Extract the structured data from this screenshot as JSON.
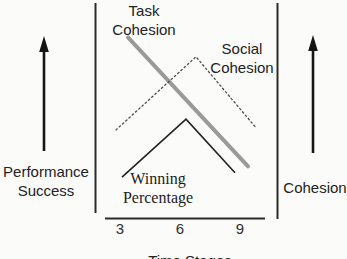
{
  "figure": {
    "background": "#fbfbfa",
    "frame_color": "#2b2b2b",
    "arrow_color": "#151515"
  },
  "axis_labels": {
    "left_line1": "Performance",
    "left_line2": "Success",
    "right": "Cohesion",
    "bottom": "Time Stages"
  },
  "series_labels": {
    "task_line1": "Task",
    "task_line2": "Cohesion",
    "social_line1": "Social",
    "social_line2": "Cohesion",
    "winning_line1": "Winning",
    "winning_line2": "Percentage"
  },
  "chart_data": {
    "type": "line",
    "title": "",
    "xlabel": "Time Stages",
    "x_ticks": [
      "3",
      "6",
      "9"
    ],
    "x_range": [
      3,
      9
    ],
    "left_axis_meaning": "Performance Success increases upward",
    "right_axis_meaning": "Cohesion increases upward",
    "y_scale": "relative level 0-1 (no numeric y ticks shown)",
    "grid": "off",
    "series": [
      {
        "id": "task-cohesion",
        "name": "Task Cohesion",
        "style": "thick solid gray",
        "color": "#9a9a9a",
        "stroke_width": 4,
        "dash": null,
        "points": [
          [
            3.4,
            0.84
          ],
          [
            9.4,
            0.24
          ]
        ],
        "trend": "steadily decreasing across time stages"
      },
      {
        "id": "social-cohesion",
        "name": "Social Cohesion",
        "style": "dotted thin",
        "color": "#4a4a4a",
        "stroke_width": 1.3,
        "dash": "1.6 2.8",
        "points": [
          [
            2.8,
            0.41
          ],
          [
            6.8,
            0.75
          ],
          [
            9.8,
            0.42
          ]
        ],
        "trend": "rises to a peak after stage 6 then falls"
      },
      {
        "id": "winning-percentage",
        "name": "Winning Percentage",
        "style": "thin solid black",
        "color": "#222222",
        "stroke_width": 1.6,
        "dash": null,
        "points": [
          [
            3.1,
            0.19
          ],
          [
            6.3,
            0.46
          ],
          [
            8.75,
            0.21
          ]
        ],
        "trend": "rises to a peak near stage 6 then falls"
      }
    ]
  }
}
